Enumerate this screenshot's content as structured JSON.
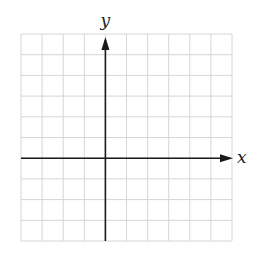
{
  "figure": {
    "type": "coordinate-grid",
    "grid": {
      "columns": 10,
      "rows": 10,
      "left": 21,
      "top": 34,
      "cell_width": 21.1,
      "cell_height": 20.7,
      "line_color": "#d6d6d6"
    },
    "axes": {
      "color": "#1a1a1a",
      "origin_column": 4,
      "origin_row": 6,
      "x_label": "x",
      "y_label": "y"
    }
  }
}
